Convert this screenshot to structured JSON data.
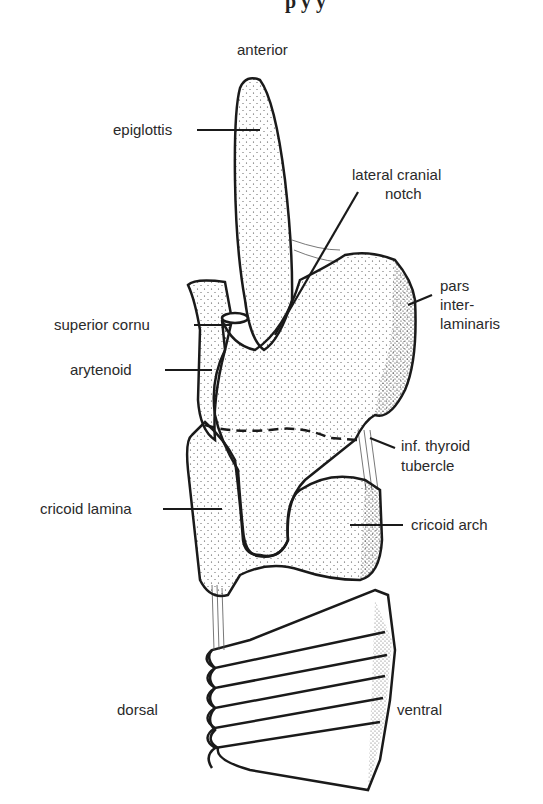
{
  "header_fragment": "p  y  y",
  "orientation": {
    "anterior": "anterior",
    "dorsal": "dorsal",
    "ventral": "ventral"
  },
  "labels": {
    "epiglottis": "epiglottis",
    "lateral_cranial_notch_1": "lateral cranial",
    "lateral_cranial_notch_2": "notch",
    "pars_1": "pars",
    "pars_2": "inter-",
    "pars_3": "laminaris",
    "superior_cornu": "superior cornu",
    "arytenoid": "arytenoid",
    "inf_thyroid_1": "inf. thyroid",
    "inf_thyroid_2": "tubercle",
    "cricoid_lamina": "cricoid lamina",
    "cricoid_arch": "cricoid arch"
  },
  "colors": {
    "ink": "#1a1a1a",
    "paper": "#ffffff",
    "label": "#2a2a2a"
  }
}
